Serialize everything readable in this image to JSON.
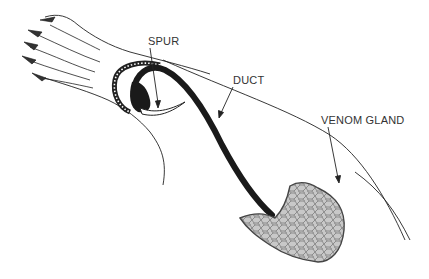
{
  "diagram": {
    "labels": {
      "spur": "SPUR",
      "duct": "DUCT",
      "venom_gland": "VENOM GLAND"
    },
    "colors": {
      "line": "#222222",
      "duct": "#1a1a1a",
      "gland_fill": "#c8c8c8",
      "gland_pattern": "#555555",
      "background": "#ffffff"
    }
  }
}
